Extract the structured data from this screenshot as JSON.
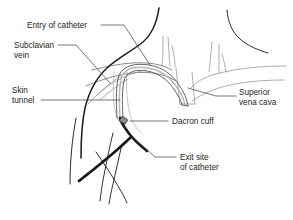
{
  "figure": {
    "background_color": "#ffffff",
    "width": 293,
    "height": 220,
    "line_color": "#1a1a1a",
    "vessel_color": "#8a8a8d",
    "text_color": "#231f20"
  },
  "labels": {
    "entry_of_catheter": {
      "line1": "Entry of catheter",
      "line2": ""
    },
    "subclavian_vein": {
      "line1": "Subclavian",
      "line2": "vein"
    },
    "skin_tunnel": {
      "line1": "Skin",
      "line2": "tunnel"
    },
    "superior_vena_cava": {
      "line1": "Superior",
      "line2": "vena cava"
    },
    "dacron_cuff": {
      "line1": "Dacron cuff",
      "line2": ""
    },
    "exit_site_of_catheter": {
      "line1": "Exit site",
      "line2": "of catheter"
    }
  }
}
